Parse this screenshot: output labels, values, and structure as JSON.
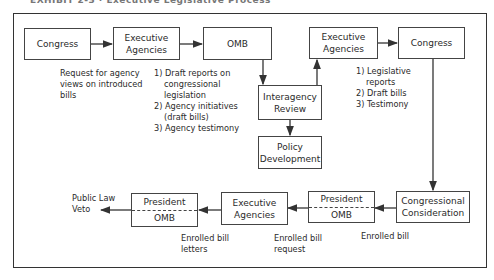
{
  "title": "EXHIBIT 2-3 · Executive Legislative Process",
  "nodes": {
    "congress_start": {
      "label": "Congress"
    },
    "exec_agencies_1": {
      "line1": "Executive",
      "line2": "Agencies"
    },
    "omb": {
      "label": "OMB"
    },
    "interagency_review": {
      "line1": "Interagency",
      "line2": "Review"
    },
    "policy_development": {
      "line1": "Policy",
      "line2": "Development"
    },
    "exec_agencies_2": {
      "line1": "Executive",
      "line2": "Agencies"
    },
    "congress_end": {
      "label": "Congress"
    },
    "congressional_consideration": {
      "line1": "Congressional",
      "line2": "Consideration"
    },
    "president_omb_1": {
      "top": "President",
      "bottom": "OMB"
    },
    "exec_agencies_3": {
      "line1": "Executive",
      "line2": "Agencies"
    },
    "president_omb_2": {
      "top": "President",
      "bottom": "OMB"
    }
  },
  "notes": {
    "request": [
      "Request for agency",
      "views on introduced",
      "bills"
    ],
    "agency_outputs": [
      "1) Draft reports on",
      "congressional",
      "legislation",
      "2) Agency initiatives",
      "(draft bills)",
      "3) Agency testimony"
    ],
    "legislative_outputs": [
      "1) Legislative",
      "reports",
      "2) Draft bills",
      "3) Testimony"
    ],
    "enrolled_bill": "Enrolled bill",
    "enrolled_bill_request": [
      "Enrolled bill",
      "request"
    ],
    "enrolled_bill_letters": [
      "Enrolled bill",
      "letters"
    ],
    "outcome": [
      "Public Law",
      "Veto"
    ]
  },
  "colors": {
    "line": "#333333",
    "text": "#2a2a2a"
  }
}
